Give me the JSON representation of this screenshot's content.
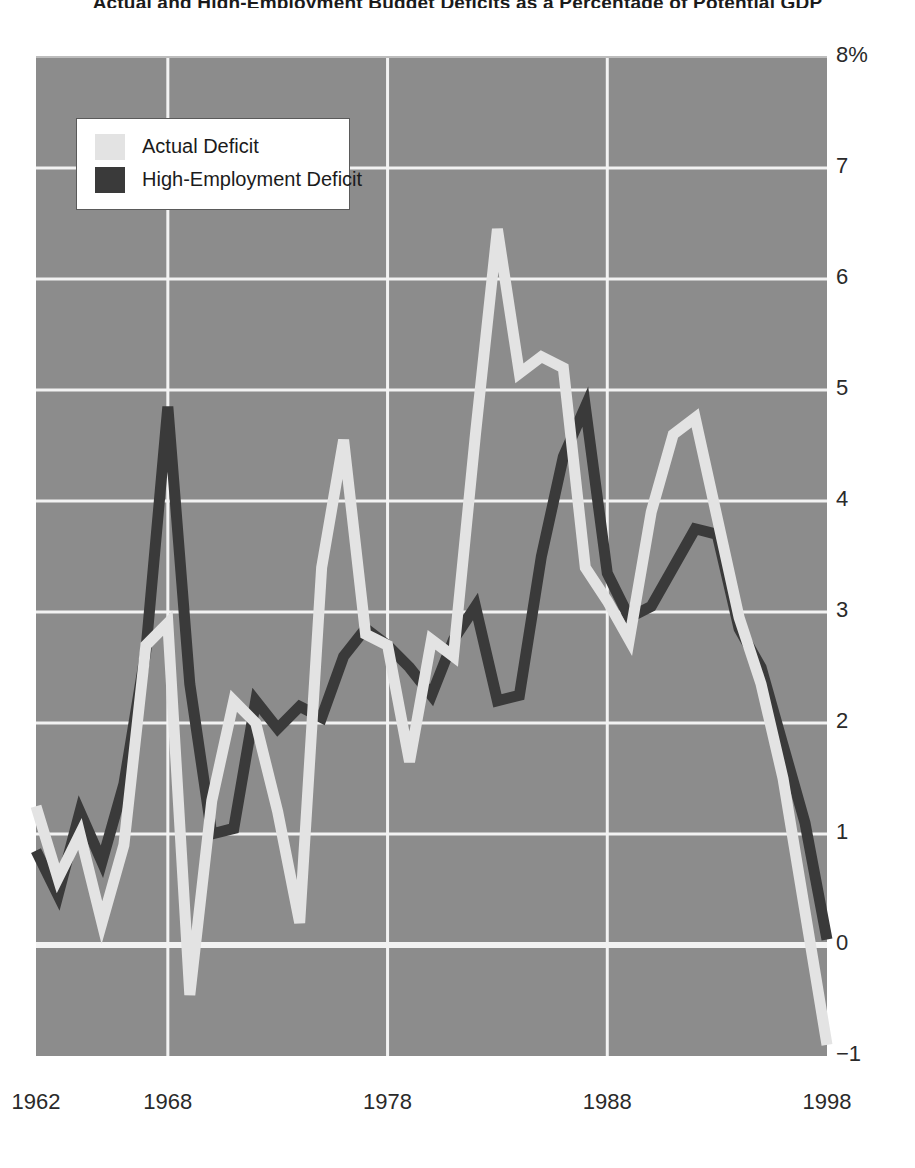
{
  "title": "Actual and High-Employment Budget Deficits as a Percentage of Potential GDP",
  "legend": {
    "position": "top-left",
    "entries": [
      {
        "label": "Actual Deficit",
        "color": "#e3e3e3",
        "swatch": "actual-deficit-swatch"
      },
      {
        "label": "High-Employment Deficit",
        "color": "#3a3a3a",
        "swatch": "high-employment-deficit-swatch"
      }
    ]
  },
  "axes": {
    "y_ticks": [
      "8%",
      "7",
      "6",
      "5",
      "4",
      "3",
      "2",
      "1",
      "0",
      "−1"
    ],
    "x_ticks": [
      "1962",
      "1968",
      "1978",
      "1988",
      "1998"
    ]
  },
  "colors": {
    "plot_background": "#8c8c8c",
    "gridline": "#f2f2f2",
    "actual": "#e3e3e3",
    "high_employment": "#3a3a3a",
    "text": "#2a2a2a"
  },
  "chart_data": {
    "type": "line",
    "title": "Actual and High-Employment Budget Deficits as a Percentage of Potential GDP",
    "xlabel": "",
    "ylabel": "Percent of potential GDP",
    "xlim": [
      1962,
      1998
    ],
    "ylim": [
      -1,
      8
    ],
    "grid": true,
    "legend_position": "top-left",
    "x": [
      1962,
      1963,
      1964,
      1965,
      1966,
      1967,
      1968,
      1969,
      1970,
      1971,
      1972,
      1973,
      1974,
      1975,
      1976,
      1977,
      1978,
      1979,
      1980,
      1981,
      1982,
      1983,
      1984,
      1985,
      1986,
      1987,
      1988,
      1989,
      1990,
      1991,
      1992,
      1993,
      1994,
      1995,
      1996,
      1997,
      1998
    ],
    "series": [
      {
        "name": "Actual Deficit",
        "color": "#e3e3e3",
        "values": [
          1.25,
          0.6,
          1.0,
          0.2,
          0.9,
          2.7,
          2.9,
          -0.45,
          1.3,
          2.2,
          2.0,
          1.2,
          0.2,
          3.4,
          4.55,
          2.8,
          2.7,
          1.65,
          2.75,
          2.6,
          4.6,
          6.45,
          5.15,
          5.3,
          5.2,
          3.4,
          3.1,
          2.75,
          3.9,
          4.6,
          4.75,
          3.85,
          2.95,
          2.35,
          1.5,
          0.3,
          -0.9
        ]
      },
      {
        "name": "High-Employment Deficit",
        "color": "#3a3a3a",
        "values": [
          0.85,
          0.45,
          1.2,
          0.75,
          1.45,
          2.65,
          4.85,
          2.35,
          1.0,
          1.05,
          2.2,
          1.95,
          2.15,
          2.05,
          2.6,
          2.85,
          2.7,
          2.5,
          2.25,
          2.75,
          3.05,
          2.2,
          2.25,
          3.5,
          4.4,
          4.85,
          3.35,
          2.95,
          3.05,
          3.4,
          3.75,
          3.7,
          2.85,
          2.5,
          1.8,
          1.1,
          0.05
        ]
      }
    ]
  }
}
